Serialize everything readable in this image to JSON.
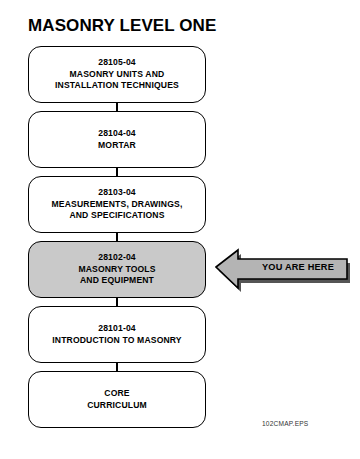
{
  "title": "MASONRY LEVEL ONE",
  "colors": {
    "page_background": "#ffffff",
    "box_outline": "#000000",
    "box_fill": "#ffffff",
    "current_box_fill": "#c9c9c9",
    "callout_fill": "#b4b4b4",
    "callout_shadow": "#555555",
    "text": "#000000"
  },
  "flow": {
    "orientation": "vertical-top-to-bottom",
    "modules": [
      {
        "code": "28105-04",
        "lines": [
          "28105-04",
          "MASONRY UNITS AND",
          "INSTALLATION TECHNIQUES"
        ],
        "current": false
      },
      {
        "code": "28104-04",
        "lines": [
          "28104-04",
          "MORTAR"
        ],
        "current": false
      },
      {
        "code": "28103-04",
        "lines": [
          "28103-04",
          "MEASUREMENTS, DRAWINGS,",
          "AND SPECIFICATIONS"
        ],
        "current": false
      },
      {
        "code": "28102-04",
        "lines": [
          "28102-04",
          "MASONRY TOOLS",
          "AND EQUIPMENT"
        ],
        "current": true
      },
      {
        "code": "28101-04",
        "lines": [
          "28101-04",
          "INTRODUCTION TO MASONRY"
        ],
        "current": false
      },
      {
        "code": "CORE",
        "lines": [
          "CORE",
          "CURRICULUM"
        ],
        "current": false
      }
    ]
  },
  "callout": {
    "label": "YOU ARE HERE",
    "points_to": "28102-04",
    "direction": "left"
  },
  "caption": "102CMAP.EPS",
  "icons": {
    "callout_arrow": "arrow-left-icon"
  }
}
